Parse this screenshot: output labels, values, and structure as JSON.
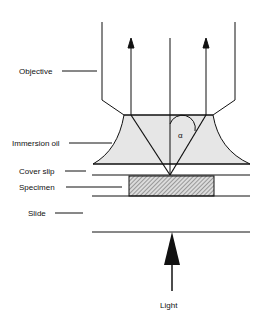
{
  "diagram": {
    "type": "oil-immersion-microscopy-schematic",
    "labels": {
      "objective": "Objective",
      "immersion_oil": "Immersion oil",
      "cover_slip": "Cover slip",
      "specimen": "Specimen",
      "slide": "Slide",
      "light": "Light",
      "angle": "α"
    },
    "colors": {
      "line": "#111111",
      "oil_fill": "#e6e6e6",
      "specimen_hatch": "#555555"
    }
  }
}
